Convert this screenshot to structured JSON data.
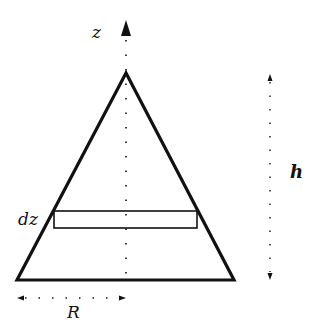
{
  "diagram": {
    "labels": {
      "z_axis": "z",
      "height": "h",
      "slice_thickness": "dz",
      "radius": "R"
    },
    "colors": {
      "stroke": "#111111",
      "background": "#ffffff"
    },
    "geometry": {
      "apex": [
        126,
        73
      ],
      "base_left": [
        17,
        280
      ],
      "base_right": [
        234,
        280
      ],
      "slice_rect": {
        "x": 54,
        "y": 211,
        "w": 143,
        "h": 17
      },
      "z_axis_x": 126,
      "h_arrow_x": 270,
      "r_arrow_y": 298
    }
  }
}
